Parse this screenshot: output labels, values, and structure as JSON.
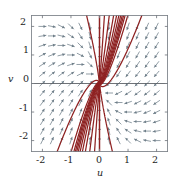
{
  "figure": {
    "kind": "phase-portrait",
    "background": "#ffffff",
    "frame_color": "#7a7f86",
    "axis_color": "#4a4f55",
    "trajectory_color": "#8e2222",
    "arrow_color": "#6d7d88"
  },
  "axes": {
    "x": {
      "title": "u",
      "min": -2.4,
      "max": 2.4,
      "ticks": [
        -2,
        -1,
        0,
        1,
        2
      ],
      "tick_labels": [
        "-2",
        "-1",
        "0",
        "1",
        "2"
      ]
    },
    "y": {
      "title": "v",
      "min": -2.4,
      "max": 2.4,
      "ticks": [
        -2,
        -1,
        0,
        1,
        2
      ],
      "tick_labels": [
        "-2",
        "-1",
        "0",
        "1",
        "2"
      ]
    }
  },
  "chart_data": {
    "type": "line",
    "title": "",
    "subtitle": "",
    "xlabel": "u",
    "ylabel": "v",
    "xlim": [
      -2.4,
      2.4
    ],
    "ylim": [
      -2.4,
      2.4
    ],
    "xticks": [
      -2,
      -1,
      0,
      1,
      2
    ],
    "yticks": [
      -2,
      -1,
      0,
      1,
      2
    ],
    "grid": false,
    "legend": "none",
    "annotations": [],
    "equilibrium": {
      "u": 0,
      "v": 0,
      "type": "stable-node"
    },
    "system": {
      "du_dt": "-u",
      "dv_dt": "-u - v",
      "jacobian": [
        [
          -1,
          0
        ],
        [
          -1,
          -1
        ]
      ],
      "eigenvalues": [
        -1,
        -1
      ],
      "eigenvector": [
        0,
        1
      ]
    },
    "vector_field": {
      "grid_u": [
        -2.0,
        -1.6667,
        -1.3333,
        -1.0,
        -0.6667,
        -0.3333,
        0.0,
        0.3333,
        0.6667,
        1.0,
        1.3333,
        1.6667,
        2.0
      ],
      "grid_v": [
        -2.0,
        -1.6667,
        -1.3333,
        -1.0,
        -0.6667,
        -0.3333,
        0.0,
        0.3333,
        0.6667,
        1.0,
        1.3333,
        1.6667,
        2.0
      ],
      "arrow_rule": "direction = normalize(-u, -u - v); arrows point toward the origin"
    },
    "trajectories": {
      "count": 22,
      "note": "solution curves of du/dt=-u, dv/dt=-u-v; all spiral-free curves approach the origin tangent to the v-axis",
      "initial_conditions": [
        {
          "u": -2.4,
          "v": -2.4
        },
        {
          "u": -2.4,
          "v": -1.5
        },
        {
          "u": -2.4,
          "v": -0.7
        },
        {
          "u": -2.4,
          "v": 0.0
        },
        {
          "u": -2.4,
          "v": 0.9
        },
        {
          "u": -2.4,
          "v": 1.8
        },
        {
          "u": -1.6,
          "v": 2.4
        },
        {
          "u": -1.0,
          "v": 2.4
        },
        {
          "u": -0.55,
          "v": 2.4
        },
        {
          "u": -0.25,
          "v": 2.4
        },
        {
          "u": 0.0,
          "v": 2.4
        },
        {
          "u": 0.25,
          "v": 2.4
        },
        {
          "u": 0.55,
          "v": 2.4
        },
        {
          "u": 1.0,
          "v": 2.4
        },
        {
          "u": 1.6,
          "v": 2.4
        },
        {
          "u": 2.4,
          "v": 1.8
        },
        {
          "u": 2.4,
          "v": 0.9
        },
        {
          "u": 2.4,
          "v": 0.0
        },
        {
          "u": 2.4,
          "v": -0.7
        },
        {
          "u": 2.4,
          "v": -1.5
        },
        {
          "u": 2.4,
          "v": -2.4
        },
        {
          "u": 0.0,
          "v": -2.4
        }
      ]
    }
  }
}
